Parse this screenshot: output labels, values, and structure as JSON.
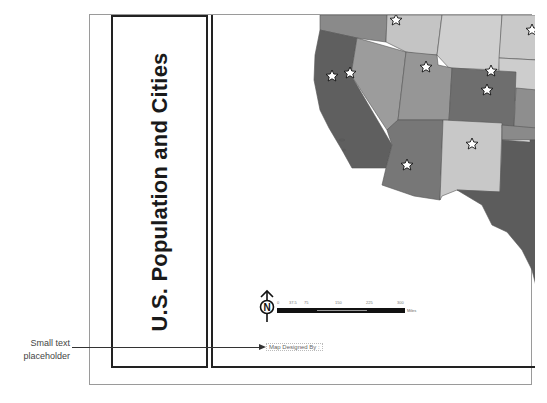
{
  "layout": {
    "title": "U.S. Population and Cities"
  },
  "map": {
    "legend_colors": {
      "dark": "#5e5e5e",
      "medium_dark": "#7a7a7a",
      "medium": "#9a9a9a",
      "light": "#c8c8c8",
      "lightest": "#d6d6d6"
    },
    "city_marker": "star-icon",
    "north_arrow_letter": "N",
    "scale_bar": {
      "labels": [
        "0",
        "37.5",
        "75",
        "150",
        "225",
        "300"
      ],
      "units": "Miles"
    },
    "designed_by": "Map Designed By :"
  },
  "annotation": {
    "callout_label_line1": "Small text",
    "callout_label_line2": "placeholder"
  }
}
